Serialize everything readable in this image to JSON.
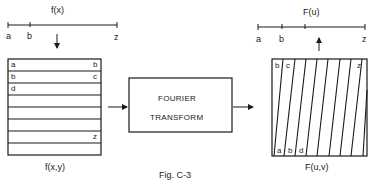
{
  "figure": {
    "caption": "Fig. C-3",
    "left": {
      "axis_title": "f(x)",
      "axis_labels": [
        "a",
        "b",
        "z"
      ],
      "grid_title": "f(x,y)",
      "row_labels": [
        {
          "left": "a",
          "right": "b"
        },
        {
          "left": "b",
          "right": "c"
        },
        {
          "left": "d",
          "right": ""
        },
        {
          "left": "",
          "right": ""
        },
        {
          "left": "",
          "right": ""
        },
        {
          "left": "",
          "right": ""
        },
        {
          "left": "",
          "right": "z"
        },
        {
          "left": "",
          "right": ""
        }
      ]
    },
    "middle": {
      "line1": "FOURIER",
      "line2": "TRANSFORM"
    },
    "right": {
      "axis_title": "F(u)",
      "axis_labels": [
        "a",
        "b",
        "z"
      ],
      "grid_title": "F(u,v)",
      "top_labels": [
        "b",
        "c",
        "z"
      ],
      "bottom_labels": [
        "a",
        "b",
        "d"
      ]
    }
  },
  "colors": {
    "ink": "#1a1a1a",
    "background": "#ffffff"
  }
}
